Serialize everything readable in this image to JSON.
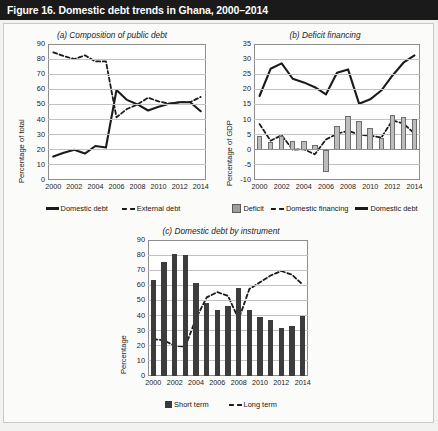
{
  "figure": {
    "title": "Figure 16. Domestic debt trends in Ghana, 2000–2014",
    "background_color": "#f2f2f0",
    "title_bar_color": "#1a1a1a"
  },
  "chart_data": [
    {
      "id": "a",
      "type": "line",
      "title": "(a) Composition of public debt",
      "xlabel": "",
      "ylabel": "Percentage of total",
      "ylim": [
        0,
        90
      ],
      "yticks": [
        0,
        10,
        20,
        30,
        40,
        50,
        60,
        70,
        80,
        90
      ],
      "xticks": [
        "2000",
        "2002",
        "2004",
        "2006",
        "2008",
        "2010",
        "2012",
        "2014"
      ],
      "x": [
        2000,
        2001,
        2002,
        2003,
        2004,
        2005,
        2006,
        2007,
        2008,
        2009,
        2010,
        2011,
        2012,
        2013,
        2014
      ],
      "grid": true,
      "legend_position": "bottom",
      "series": [
        {
          "name": "Domestic debt",
          "style": "solid",
          "color": "#1b1b1b",
          "values": [
            15.5,
            18.0,
            20.0,
            17.5,
            22.5,
            21.5,
            59.5,
            53.0,
            50.0,
            46.0,
            48.5,
            50.5,
            51.5,
            51.5,
            45.5
          ]
        },
        {
          "name": "External debt",
          "style": "dashed",
          "color": "#1b1b1b",
          "values": [
            84.5,
            82.0,
            80.0,
            82.5,
            78.5,
            78.5,
            41.5,
            47.0,
            50.0,
            54.5,
            52.0,
            50.5,
            51.5,
            51.5,
            55.0
          ]
        }
      ]
    },
    {
      "id": "b",
      "type": "combo",
      "title": "(b) Deficit financing",
      "xlabel": "",
      "ylabel": "Percentage of GDP",
      "ylim": [
        -10,
        35
      ],
      "yticks": [
        -10,
        -5,
        0,
        5,
        10,
        15,
        20,
        25,
        30,
        35
      ],
      "xticks": [
        "2000",
        "2002",
        "2004",
        "2006",
        "2008",
        "2010",
        "2012",
        "2014"
      ],
      "x": [
        2000,
        2001,
        2002,
        2003,
        2004,
        2005,
        2006,
        2007,
        2008,
        2009,
        2010,
        2011,
        2012,
        2013,
        2014
      ],
      "grid": true,
      "legend_position": "bottom",
      "series": [
        {
          "name": "Deficit",
          "style": "bar",
          "color": "#bdbdbd",
          "values": [
            4.6,
            2.6,
            4.5,
            2.9,
            2.9,
            1.5,
            -7.3,
            8.0,
            11.3,
            9.4,
            7.1,
            3.9,
            11.6,
            11.0,
            10.3
          ]
        },
        {
          "name": "Domestic financing",
          "style": "dashed",
          "color": "#1b1b1b",
          "values": [
            8.5,
            3.0,
            4.8,
            0.0,
            0.2,
            -1.5,
            3.4,
            5.3,
            6.3,
            5.0,
            4.7,
            4.0,
            9.7,
            8.7,
            5.4
          ]
        },
        {
          "name": "Domestic debt",
          "style": "solid",
          "color": "#1b1b1b",
          "values": [
            17.8,
            26.8,
            28.6,
            23.5,
            22.3,
            20.7,
            18.3,
            25.5,
            26.6,
            15.2,
            16.7,
            19.6,
            24.5,
            28.8,
            31.2
          ]
        }
      ]
    },
    {
      "id": "c",
      "type": "combo",
      "title": "(c) Domestic debt by instrument",
      "xlabel": "",
      "ylabel": "Percentage",
      "ylim": [
        0,
        90
      ],
      "yticks": [
        0,
        10,
        20,
        30,
        40,
        50,
        60,
        70,
        80,
        90
      ],
      "xticks": [
        "2000",
        "2002",
        "2004",
        "2006",
        "2008",
        "2010",
        "2012",
        "2014"
      ],
      "x": [
        2000,
        2001,
        2002,
        2003,
        2004,
        2005,
        2006,
        2007,
        2008,
        2009,
        2010,
        2011,
        2012,
        2013,
        2014
      ],
      "grid": true,
      "legend_position": "bottom",
      "series": [
        {
          "name": "Short term",
          "style": "bar",
          "color": "#3c3c3c",
          "values": [
            63.5,
            75.5,
            80.5,
            80.0,
            61.5,
            48.0,
            44.0,
            46.5,
            58.5,
            43.5,
            39.0,
            37.0,
            31.5,
            33.0,
            39.5
          ]
        },
        {
          "name": "Long term",
          "style": "dashed",
          "color": "#1b1b1b",
          "values": [
            24.5,
            23.5,
            20.0,
            19.5,
            38.0,
            52.0,
            55.5,
            53.0,
            37.5,
            57.5,
            62.0,
            66.5,
            69.5,
            67.0,
            60.5
          ]
        }
      ]
    }
  ]
}
